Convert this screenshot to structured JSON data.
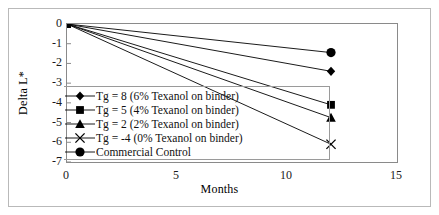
{
  "chart_data": {
    "type": "line",
    "title": "",
    "xlabel": "Months",
    "ylabel": "Delta L*",
    "xlim": [
      0,
      15
    ],
    "ylim": [
      -7,
      0
    ],
    "xticks": [
      "0",
      "5",
      "10",
      "15"
    ],
    "xtick_values": [
      0,
      5,
      10,
      15
    ],
    "yticks": [
      "0",
      "-1",
      "-2",
      "-3",
      "-4",
      "-5",
      "-6",
      "-7"
    ],
    "ytick_values": [
      0,
      -1,
      -2,
      -3,
      -4,
      -5,
      -6,
      -7
    ],
    "grid": false,
    "legend_position": "center-left",
    "x": [
      0,
      12
    ],
    "series": [
      {
        "name": "Tg = 8 (6% Texanol on binder)",
        "marker": "diamond",
        "values": [
          0,
          -2.4
        ]
      },
      {
        "name": "Tg = 5 (4% Texanol on binder)",
        "marker": "square",
        "values": [
          0,
          -4.1
        ]
      },
      {
        "name": "Tg = 2 (2% Texanol on binder)",
        "marker": "triangle",
        "values": [
          0,
          -4.75
        ]
      },
      {
        "name": "Tg = -4 (0% Texanol on binder)",
        "marker": "x",
        "values": [
          0,
          -6.1
        ]
      },
      {
        "name": "Commercial Control",
        "marker": "circle",
        "values": [
          0,
          -1.45
        ]
      }
    ],
    "colors": {
      "series": "#000000",
      "axis": "#8a8a8a",
      "frame": "#b9b9b9",
      "text": "#111111",
      "background": "#ffffff"
    }
  }
}
